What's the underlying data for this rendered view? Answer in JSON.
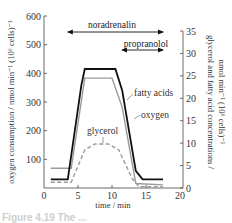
{
  "chart_data": {
    "type": "line",
    "title": "",
    "xlabel": "time / min",
    "ylabel": "oxygen consumption / nmol min⁻¹ (10⁶ cells)⁻¹",
    "ylabel_right": "glycerol and fatty acid concentrations / nmol min⁻¹ (10⁶ cells)⁻¹",
    "xlim": [
      0,
      20
    ],
    "ylim": [
      0,
      600
    ],
    "ylim_right": [
      0,
      35
    ],
    "xticks": [
      0,
      5,
      10,
      15,
      20
    ],
    "yticks": [
      100,
      200,
      300,
      400,
      500,
      600
    ],
    "yticks_right": [
      0,
      5,
      10,
      15,
      20,
      25,
      30,
      35
    ],
    "grid": false,
    "legend": "inline labels",
    "series": [
      {
        "name": "oxygen",
        "axis": "left",
        "style": "solid-black",
        "x": [
          1,
          3.5,
          5.5,
          6,
          10.5,
          11.5,
          13.5,
          14.5,
          17.5
        ],
        "y": [
          30,
          30,
          360,
          415,
          415,
          340,
          60,
          30,
          30
        ]
      },
      {
        "name": "fatty acids",
        "axis": "right",
        "style": "solid-grey",
        "x": [
          1,
          4,
          6,
          10,
          11.5,
          13.5,
          17.5
        ],
        "y": [
          4.4,
          4.4,
          24.5,
          24.5,
          18,
          1,
          0.7
        ]
      },
      {
        "name": "glycerol",
        "axis": "right",
        "style": "dashed-grey",
        "x": [
          1,
          4,
          6,
          7.5,
          9.5,
          11,
          13,
          14,
          17.5
        ],
        "y": [
          1.3,
          1.3,
          8.5,
          9.8,
          9.8,
          8.5,
          2,
          0.3,
          0.3
        ]
      }
    ],
    "annotations": [
      {
        "text": "noradrenalin",
        "type": "double-arrow",
        "x_start": 3.5,
        "x_end": 17.5
      },
      {
        "text": "propranolol",
        "type": "double-arrow",
        "x_start": 11.5,
        "x_end": 17.5
      }
    ]
  },
  "labels": {
    "xlabel": "time / min",
    "ylabel_left": "oxygen consumption / nmol min⁻¹ (10⁶ cells)⁻¹",
    "ylabel_right_line1": "glycerol and fatty acid concentrations /",
    "ylabel_right_line2": "nmol min⁻¹ (10⁶ cells)⁻¹",
    "noradrenalin": "noradrenalin",
    "propranolol": "propranolol",
    "fatty_acids": "fatty acids",
    "oxygen": "oxygen",
    "glycerol": "glycerol"
  },
  "caption": "Figure 4.19  The ..."
}
